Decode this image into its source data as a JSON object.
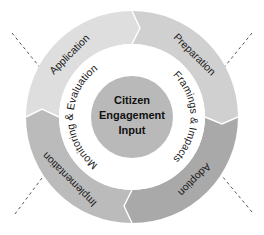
{
  "diagram": {
    "type": "cycle",
    "center": {
      "lines": [
        "Citizen",
        "Engagement",
        "Input"
      ],
      "color": "#b9b9b9"
    },
    "outer_ring": [
      {
        "label": "Application",
        "color": "#dedede"
      },
      {
        "label": "Preparation",
        "color": "#d0d0d0"
      },
      {
        "label": "Adoption",
        "color": "#a9a9a9"
      },
      {
        "label": "Implementation",
        "color": "#bbbbbb"
      }
    ],
    "inner_ring": [
      {
        "label": "Framings & Impacts"
      },
      {
        "label": "Monitoring & Evaluation"
      }
    ],
    "inner_ring_color": "#ffffff"
  }
}
